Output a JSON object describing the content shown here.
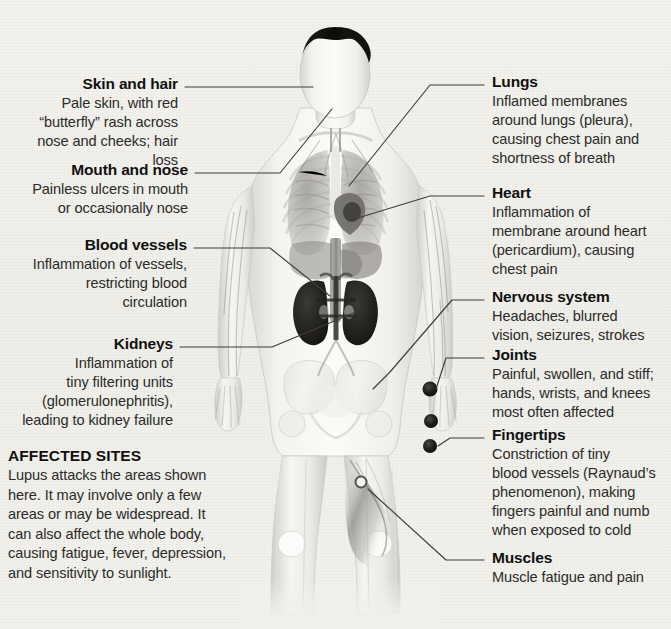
{
  "figure": {
    "background_color": "#f1f0ea",
    "line_color": "#3a3a3a",
    "marker_color": "#1a1a1a"
  },
  "callouts_left": [
    {
      "name": "skin-and-hair",
      "title": "Skin and hair",
      "lines": [
        "Pale skin, with red",
        "“butterfly” rash across",
        "nose and cheeks; hair loss"
      ]
    },
    {
      "name": "mouth-and-nose",
      "title": "Mouth and nose",
      "lines": [
        "Painless ulcers in mouth",
        "or occasionally nose"
      ]
    },
    {
      "name": "blood-vessels",
      "title": "Blood vessels",
      "lines": [
        "Inflammation of vessels,",
        "restricting blood",
        "circulation"
      ]
    },
    {
      "name": "kidneys",
      "title": "Kidneys",
      "lines": [
        "Inflammation of",
        "tiny filtering units",
        "(glomerulonephritis),",
        "leading to kidney failure"
      ]
    }
  ],
  "callouts_right": [
    {
      "name": "lungs",
      "title": "Lungs",
      "lines": [
        "Inflamed membranes",
        "around lungs (pleura),",
        "causing chest pain and",
        "shortness of breath"
      ]
    },
    {
      "name": "heart",
      "title": "Heart",
      "lines": [
        "Inflammation of",
        "membrane around heart",
        "(pericardium), causing",
        "chest pain"
      ]
    },
    {
      "name": "nervous-system",
      "title": "Nervous system",
      "lines": [
        "Headaches, blurred",
        "vision, seizures, strokes"
      ]
    },
    {
      "name": "joints",
      "title": "Joints",
      "lines": [
        "Painful, swollen, and stiff;",
        "hands, wrists, and knees",
        "most often affected"
      ]
    },
    {
      "name": "fingertips",
      "title": "Fingertips",
      "lines": [
        "Constriction of tiny",
        "blood vessels (Raynaud’s",
        "phenomenon), making",
        "fingers painful and numb",
        "when exposed to cold"
      ]
    },
    {
      "name": "muscles",
      "title": "Muscles",
      "lines": [
        "Muscle fatigue and pain"
      ]
    }
  ],
  "affected_sites": {
    "title": "AFFECTED SITES",
    "lines": [
      "Lupus attacks the areas shown",
      "here. It may involve only a few",
      "areas or may be widespread. It",
      "can also affect the whole body,",
      "causing fatigue, fever, depression,",
      "and sensitivity to sunlight."
    ]
  }
}
